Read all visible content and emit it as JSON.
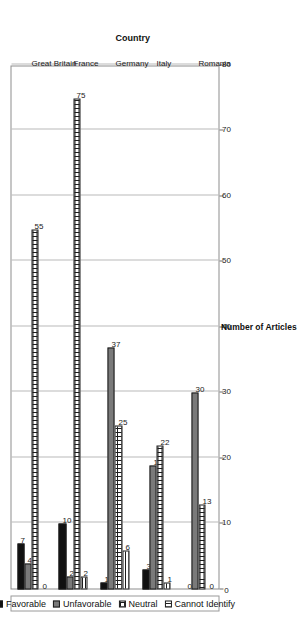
{
  "chart_data": {
    "type": "bar",
    "orientation": "grouped-bar",
    "title": "",
    "xlabel": "Country",
    "ylabel": "Number of Articles",
    "ylim": [
      0,
      80
    ],
    "ytick_labels": [
      "0",
      "10",
      "20",
      "30",
      "40",
      "50",
      "60",
      "70",
      "80"
    ],
    "ytick_values": [
      0,
      10,
      20,
      30,
      40,
      50,
      60,
      70,
      80
    ],
    "grid": true,
    "legend_position": "bottom",
    "categories": [
      "Great Britain",
      "France",
      "Germany",
      "Italy",
      "Romania"
    ],
    "series": [
      {
        "name": "Favorable",
        "color": "#111111",
        "pattern": "solid",
        "values": [
          7,
          10,
          1,
          3,
          0
        ]
      },
      {
        "name": "Unfavorable",
        "color": "#7a7a7a",
        "pattern": "gray",
        "values": [
          4,
          2,
          37,
          19,
          30
        ]
      },
      {
        "name": "Neutral",
        "color": "#ffffff",
        "pattern": "crosshatch",
        "values": [
          55,
          75,
          25,
          22,
          13
        ]
      },
      {
        "name": "Cannot Identify",
        "color": "#ffffff",
        "pattern": "horizontal",
        "values": [
          0,
          2,
          6,
          1,
          0
        ]
      }
    ],
    "data_labels": [
      {
        "category": "Great Britain",
        "Favorable": "7",
        "Unfavorable": "4",
        "Neutral": "55",
        "Cannot Identify": "0"
      },
      {
        "category": "France",
        "Favorable": "10",
        "Unfavorable": "2",
        "Neutral": "75",
        "Cannot Identify": "2"
      },
      {
        "category": "Germany",
        "Favorable": "1",
        "Unfavorable": "37",
        "Neutral": "25",
        "Cannot Identify": "6"
      },
      {
        "category": "Italy",
        "Favorable": "3",
        "Unfavorable": "19",
        "Neutral": "22",
        "Cannot Identify": "1"
      },
      {
        "category": "Romania",
        "Favorable": "0",
        "Unfavorable": "30",
        "Neutral": "13",
        "Cannot Identify": "0"
      }
    ]
  }
}
